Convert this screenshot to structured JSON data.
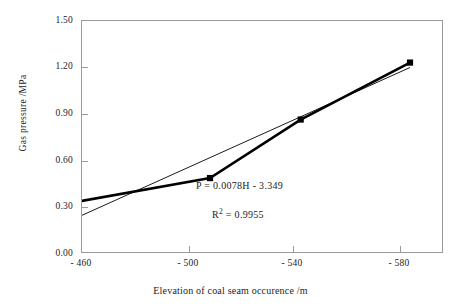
{
  "chart_data": {
    "type": "line",
    "title": "",
    "subtitle": "",
    "xlabel": "Elevation of coal seam occurence /m",
    "ylabel": "Gas pressure /MPa",
    "xlim": [
      -460,
      -595
    ],
    "ylim": [
      0.0,
      1.5
    ],
    "x_ticks": [
      "- 460",
      "- 500",
      "- 540",
      "- 580"
    ],
    "x_tick_values": [
      -460,
      -500,
      -540,
      -580
    ],
    "y_ticks": [
      "0.00",
      "0.30",
      "0.60",
      "0.90",
      "1.20",
      "1.50"
    ],
    "y_tick_values": [
      0.0,
      0.3,
      0.6,
      0.9,
      1.2,
      1.5
    ],
    "grid": false,
    "legend": "none",
    "marker": "filled-square",
    "series": [
      {
        "name": "measured",
        "style": "thick-line-with-square-markers",
        "color": "#000000",
        "x": [
          -456,
          -508,
          -542,
          -583
        ],
        "y": [
          0.32,
          0.48,
          0.86,
          1.23
        ]
      },
      {
        "name": "linear-trendline",
        "style": "thin-line",
        "color": "#000000",
        "x": [
          -456,
          -583
        ],
        "y": [
          0.207,
          1.198
        ]
      }
    ],
    "annotations": [
      {
        "name": "equation",
        "text": "P = 0.0078H - 3.349"
      },
      {
        "name": "r-squared",
        "text_prefix": "R",
        "text_sup": "2",
        "text_suffix": " =  0.9955"
      }
    ],
    "colors": {
      "axis": "#9a9a9a",
      "data": "#000000",
      "text": "#1c1c1c",
      "background": "#ffffff"
    }
  },
  "axes": {
    "y_title": "Gas pressure /MPa",
    "x_title": "Elevation of coal seam occurence /m",
    "y_labels": [
      "1.50",
      "1.20",
      "0.90",
      "0.60",
      "0.30",
      "0.00"
    ],
    "x_labels": [
      "- 460",
      "- 500",
      "- 540",
      "- 580"
    ]
  },
  "annotations": {
    "equation": "P = 0.0078H - 3.349",
    "r2_symbol": "R",
    "r2_exponent": "2",
    "r2_value": " =  0.9955"
  }
}
